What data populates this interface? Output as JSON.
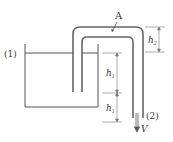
{
  "diagram": {
    "type": "siphon",
    "labels": {
      "point1": "(1)",
      "point2": "(2)",
      "pointA": "A",
      "velocity": "V",
      "h_upper": "h",
      "h_upper_sub": "1",
      "h_lower": "h",
      "h_lower_sub": "1",
      "h_top": "h",
      "h_top_sub": "2"
    },
    "colors": {
      "line": "#555555",
      "tube": "#666666",
      "dim": "#777777"
    }
  }
}
